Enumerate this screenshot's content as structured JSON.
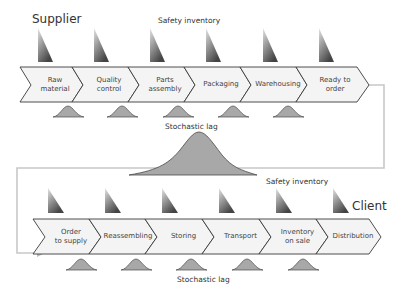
{
  "labels": {
    "supplier": "Supplier",
    "client": "Client",
    "safety_inventory_top": "Safety inventory",
    "safety_inventory_middle": "Safety inventory",
    "stochastic_lag_top": "Stochastic lag",
    "stochastic_lag_bottom": "Stochastic lag"
  },
  "top_row": {
    "steps": [
      {
        "label": "Raw\nmaterial"
      },
      {
        "label": "Quality\ncontrol"
      },
      {
        "label": "Parts\nassembly"
      },
      {
        "label": "Packaging"
      },
      {
        "label": "Warehousing"
      },
      {
        "label": "Ready  to\norder"
      }
    ]
  },
  "bottom_row": {
    "steps": [
      {
        "label": "Order\nto supply"
      },
      {
        "label": "Reassembling"
      },
      {
        "label": "Storing"
      },
      {
        "label": "Transport"
      },
      {
        "label": "Inventory\non sale"
      },
      {
        "label": "Distribution"
      }
    ]
  },
  "colors": {
    "chevron_fill": "#f4f4f4",
    "chevron_stroke": "#3a3a3a",
    "bell_fill": "#a8a8a8",
    "bell_stroke": "#4a4a4a",
    "connector": "#c8c8c8",
    "wedge_dark": "#4a4a4a",
    "wedge_light": "#dcdcdc"
  }
}
